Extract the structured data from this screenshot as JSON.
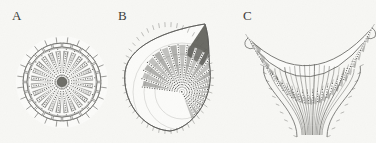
{
  "figure": {
    "background_color": "#f7f7f4",
    "ink_color": "#5a5a57",
    "dark_fill": "#6d6d6a",
    "mid_fill": "#8d8d8a",
    "light_fill": "#c9c9c5",
    "apex_fill": "#55554f",
    "panel_count": 3
  },
  "panels": [
    {
      "id": "A",
      "label": "A",
      "label_x": 12,
      "label_y": 10,
      "shape": "radial-circular-section",
      "description": "Radially symmetric circular cross-section with outer ring of trapezoidal cells bearing short outward spurs, an inner annulus of dark wedge-shaped chambers, and beaded radial spokes converging at the centre",
      "center_x": 62,
      "center_y": 82,
      "outer_radius": 43,
      "ring_cells": 24,
      "spokes": 24,
      "inner_radius": 34,
      "core_radius": 5
    },
    {
      "id": "B",
      "label": "B",
      "label_x": 118,
      "label_y": 10,
      "shape": "asymmetric-teardrop-section",
      "description": "Pear or teardrop shaped oblique section with a dark pointed apex at the upper right, spiny margin, and rows of beaded files fanning out from an eccentric focus",
      "center_x": 168,
      "center_y": 78,
      "width": 86,
      "height": 106,
      "apex_x": 205,
      "apex_y": 24,
      "focus_x": 182,
      "focus_y": 92,
      "rows": 22
    },
    {
      "id": "C",
      "label": "C",
      "label_x": 243,
      "label_y": 10,
      "shape": "crescent-with-stalk",
      "description": "Crescent or U-shaped longitudinal section, concave upward, with beaded radial files along the upper surface and converging fibre bundles forming a narrowing stalk below",
      "center_x": 310,
      "center_y": 72,
      "width": 124,
      "height": 113,
      "files": 26,
      "stalk_top_y": 82,
      "stalk_bottom_y": 135
    }
  ]
}
